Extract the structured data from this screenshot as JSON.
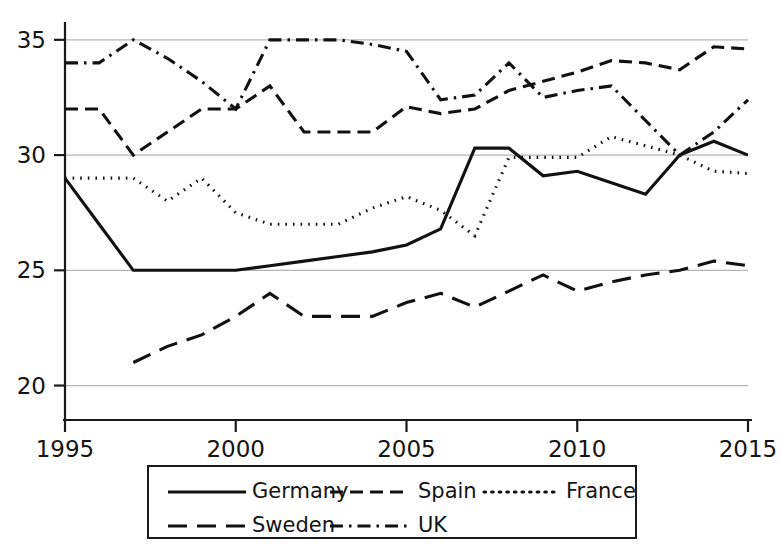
{
  "chart_data": {
    "type": "line",
    "title": "",
    "subtitle": "",
    "xlabel": "",
    "ylabel": "",
    "xlim": [
      1995,
      2015
    ],
    "ylim": [
      19.2,
      35.6
    ],
    "x_ticks": [
      "1995",
      "2000",
      "2005",
      "2010",
      "2015"
    ],
    "x_tick_values": [
      1995,
      2000,
      2005,
      2010,
      2015
    ],
    "y_ticks": [
      "20",
      "25",
      "30",
      "35"
    ],
    "y_tick_values": [
      20,
      25,
      30,
      35
    ],
    "grid": "horizontal",
    "legend_position": "bottom",
    "x": [
      1995,
      1996,
      1997,
      1998,
      1999,
      2000,
      2001,
      2002,
      2003,
      2004,
      2005,
      2006,
      2007,
      2008,
      2009,
      2010,
      2011,
      2012,
      2013,
      2014,
      2015
    ],
    "series": [
      {
        "name": "Germany",
        "dash": "solid",
        "x": [
          1995,
          1996,
          1997,
          1998,
          1999,
          2000,
          2001,
          2002,
          2003,
          2004,
          2005,
          2006,
          2007,
          2008,
          2009,
          2010,
          2011,
          2012,
          2013,
          2014,
          2015
        ],
        "values": [
          29.0,
          27.0,
          25.0,
          25.0,
          25.0,
          25.0,
          25.2,
          25.4,
          25.6,
          25.8,
          26.1,
          26.8,
          30.3,
          30.3,
          29.1,
          29.3,
          28.8,
          28.3,
          30.0,
          30.6,
          30.0
        ]
      },
      {
        "name": "Spain",
        "dash": "dashed",
        "x": [
          1995,
          1996,
          1997,
          1998,
          1999,
          2000,
          2001,
          2002,
          2003,
          2004,
          2005,
          2006,
          2007,
          2008,
          2009,
          2010,
          2011,
          2012,
          2013,
          2014,
          2015
        ],
        "values": [
          32.0,
          32.0,
          30.0,
          31.0,
          32.0,
          32.0,
          33.0,
          31.0,
          31.0,
          31.0,
          32.1,
          31.8,
          32.0,
          32.8,
          33.2,
          33.6,
          34.1,
          34.0,
          33.7,
          34.7,
          34.6
        ]
      },
      {
        "name": "France",
        "dash": "dotted",
        "x": [
          1995,
          1996,
          1997,
          1998,
          1999,
          2000,
          2001,
          2002,
          2003,
          2004,
          2005,
          2006,
          2007,
          2008,
          2009,
          2010,
          2011,
          2012,
          2013,
          2014,
          2015
        ],
        "values": [
          29.0,
          29.0,
          29.0,
          28.0,
          29.0,
          27.5,
          27.0,
          27.0,
          27.0,
          27.7,
          28.2,
          27.6,
          26.5,
          29.9,
          29.9,
          29.9,
          30.8,
          30.4,
          30.0,
          29.3,
          29.2
        ]
      },
      {
        "name": "Sweden",
        "dash": "longdash",
        "x": [
          1997,
          1998,
          1999,
          2000,
          2001,
          2002,
          2003,
          2004,
          2005,
          2006,
          2007,
          2008,
          2009,
          2010,
          2011,
          2012,
          2013,
          2014,
          2015
        ],
        "values": [
          21.0,
          21.7,
          22.2,
          23.0,
          24.0,
          23.0,
          23.0,
          23.0,
          23.6,
          24.0,
          23.4,
          24.1,
          24.8,
          24.1,
          24.5,
          24.8,
          25.0,
          25.4,
          25.2
        ]
      },
      {
        "name": "UK",
        "dash": "dashdot",
        "x": [
          1995,
          1996,
          1997,
          1998,
          1999,
          2000,
          2001,
          2002,
          2003,
          2004,
          2005,
          2006,
          2007,
          2008,
          2009,
          2010,
          2011,
          2012,
          2013,
          2014,
          2015
        ],
        "values": [
          34.0,
          34.0,
          35.0,
          34.2,
          33.2,
          32.0,
          35.0,
          35.0,
          35.0,
          34.8,
          34.5,
          32.4,
          32.6,
          34.0,
          32.5,
          32.8,
          33.0,
          31.5,
          30.0,
          31.0,
          32.4
        ]
      }
    ]
  },
  "legend": {
    "entries": [
      {
        "label": "Germany",
        "dash": "solid"
      },
      {
        "label": "Spain",
        "dash": "dashed"
      },
      {
        "label": "France",
        "dash": "dotted"
      },
      {
        "label": "Sweden",
        "dash": "longdash"
      },
      {
        "label": "UK",
        "dash": "dashdot"
      }
    ]
  },
  "colors": {
    "line": "#111111",
    "grid": "#b4b4b4",
    "axis": "#1a1a1a",
    "text": "#141414",
    "background": "#ffffff"
  }
}
